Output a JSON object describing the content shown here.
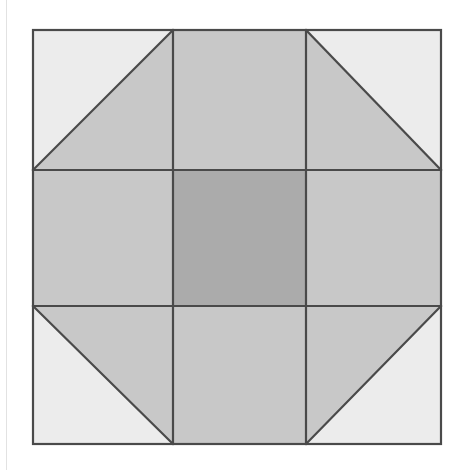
{
  "figure": {
    "canvas": {
      "width": 462,
      "height": 470,
      "background": "#ffffff"
    },
    "margin_rule": {
      "x": 6,
      "color": "#e2e2e2",
      "visible": true
    }
  },
  "colors": {
    "light": "#ececec",
    "medium": "#c8c8c8",
    "dark": "#ababab",
    "outline": "#4a4a4a",
    "background": "#ffffff"
  },
  "geometry": {
    "block": {
      "x": 33,
      "y": 30,
      "width": 408,
      "height": 414
    },
    "column_edges": [
      33,
      173,
      306,
      441
    ],
    "row_edges": [
      30,
      170,
      306,
      444
    ],
    "grid_rows": 3,
    "grid_cols": 3,
    "stroke_width": 2.2
  },
  "cells": [
    {
      "id": "cell-r0c0",
      "name": "top-left-half-square-triangle",
      "row": 0,
      "col": 0,
      "type": "half-square-triangle",
      "diagonal": "bottom-left-to-top-right",
      "fills": {
        "upper_left": "#ececec",
        "lower_right": "#c8c8c8"
      }
    },
    {
      "id": "cell-r0c1",
      "name": "top-center-square",
      "row": 0,
      "col": 1,
      "type": "solid",
      "fill": "#c8c8c8"
    },
    {
      "id": "cell-r0c2",
      "name": "top-right-half-square-triangle",
      "row": 0,
      "col": 2,
      "type": "half-square-triangle",
      "diagonal": "top-left-to-bottom-right",
      "fills": {
        "upper_right": "#ececec",
        "lower_left": "#c8c8c8"
      }
    },
    {
      "id": "cell-r1c0",
      "name": "middle-left-square",
      "row": 1,
      "col": 0,
      "type": "solid",
      "fill": "#c8c8c8"
    },
    {
      "id": "cell-r1c1",
      "name": "center-square",
      "row": 1,
      "col": 1,
      "type": "solid",
      "fill": "#ababab"
    },
    {
      "id": "cell-r1c2",
      "name": "middle-right-square",
      "row": 1,
      "col": 2,
      "type": "solid",
      "fill": "#c8c8c8"
    },
    {
      "id": "cell-r2c0",
      "name": "bottom-left-half-square-triangle",
      "row": 2,
      "col": 0,
      "type": "half-square-triangle",
      "diagonal": "top-left-to-bottom-right",
      "fills": {
        "upper_right": "#c8c8c8",
        "lower_left": "#ececec"
      }
    },
    {
      "id": "cell-r2c1",
      "name": "bottom-center-square",
      "row": 2,
      "col": 1,
      "type": "solid",
      "fill": "#c8c8c8"
    },
    {
      "id": "cell-r2c2",
      "name": "bottom-right-half-square-triangle",
      "row": 2,
      "col": 2,
      "type": "half-square-triangle",
      "diagonal": "bottom-left-to-top-right",
      "fills": {
        "upper_left": "#c8c8c8",
        "lower_right": "#ececec"
      }
    }
  ]
}
